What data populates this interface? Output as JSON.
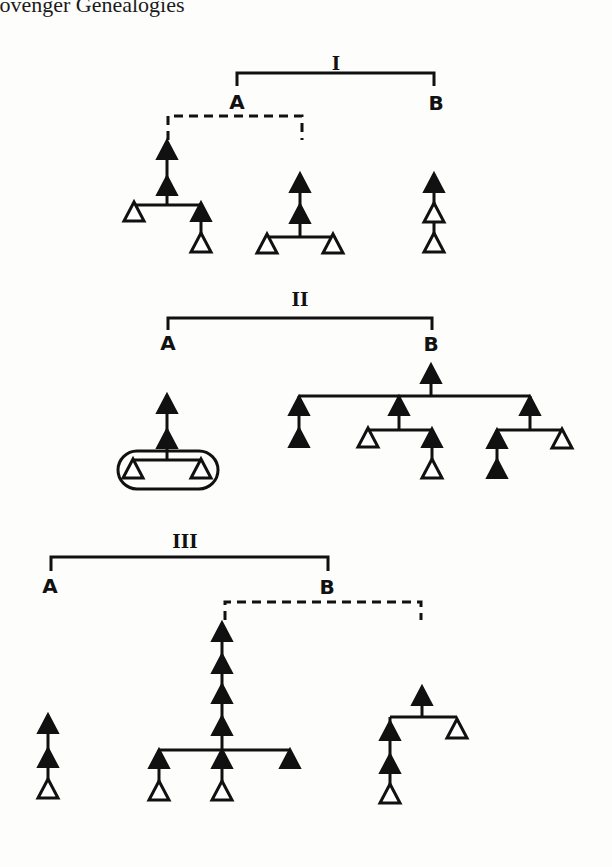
{
  "header": {
    "text": "Lövenger Genealogies"
  },
  "sections": [
    {
      "numeral": "I",
      "left_label": "A",
      "right_label": "B"
    },
    {
      "numeral": "II",
      "left_label": "A",
      "right_label": "B"
    },
    {
      "numeral": "III",
      "left_label": "A",
      "right_label": "B"
    }
  ],
  "legend": {
    "filled_triangle": "filled-triangle-node",
    "open_triangle": "open-triangle-node",
    "dashed_line": "uncertain-link",
    "solid_line": "known-link"
  },
  "colors": {
    "ink": "#111111",
    "paper": "#fdfdfc"
  }
}
